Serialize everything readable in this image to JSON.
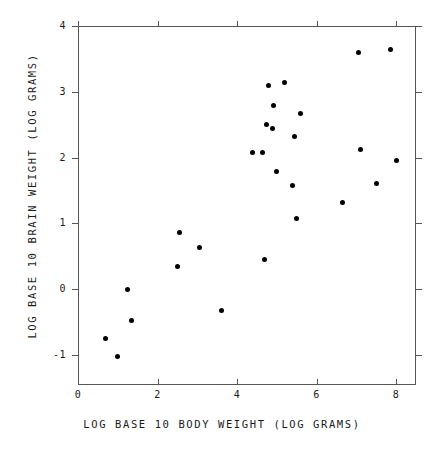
{
  "chart_data": {
    "type": "scatter",
    "title": "",
    "xlabel": "LOG BASE 10 BODY WEIGHT (LOG GRAMS)",
    "ylabel": "LOG BASE 10 BRAIN WEIGHT (LOG GRAMS)",
    "xlim": [
      0,
      8.5
    ],
    "ylim": [
      -1.5,
      4
    ],
    "xticks": [
      "0",
      "2",
      "4",
      "6",
      "8"
    ],
    "xtick_values": [
      0,
      2,
      4,
      6,
      8
    ],
    "yticks": [
      "4",
      "3",
      "2",
      "1",
      "0",
      "-1"
    ],
    "ytick_values": [
      4,
      3,
      2,
      1,
      0,
      -1
    ],
    "grid": false,
    "legend": "none",
    "marker": "filled-circle",
    "marker_color": "#000000",
    "frame_color": "#555555",
    "points": [
      {
        "x": 0.7,
        "y": -0.75
      },
      {
        "x": 1.0,
        "y": -1.02
      },
      {
        "x": 1.25,
        "y": -0.01
      },
      {
        "x": 1.35,
        "y": -0.47
      },
      {
        "x": 2.5,
        "y": 0.35
      },
      {
        "x": 2.55,
        "y": 0.86
      },
      {
        "x": 3.05,
        "y": 0.63
      },
      {
        "x": 3.6,
        "y": -0.32
      },
      {
        "x": 4.4,
        "y": 2.08
      },
      {
        "x": 4.65,
        "y": 2.08
      },
      {
        "x": 4.7,
        "y": 0.45
      },
      {
        "x": 4.75,
        "y": 2.5
      },
      {
        "x": 4.8,
        "y": 3.09
      },
      {
        "x": 4.9,
        "y": 2.44
      },
      {
        "x": 4.93,
        "y": 2.79
      },
      {
        "x": 5.0,
        "y": 1.79
      },
      {
        "x": 5.2,
        "y": 3.14
      },
      {
        "x": 5.4,
        "y": 1.57
      },
      {
        "x": 5.45,
        "y": 2.32
      },
      {
        "x": 5.5,
        "y": 1.08
      },
      {
        "x": 5.6,
        "y": 2.67
      },
      {
        "x": 6.65,
        "y": 1.32
      },
      {
        "x": 7.05,
        "y": 3.6
      },
      {
        "x": 7.1,
        "y": 2.13
      },
      {
        "x": 7.5,
        "y": 1.61
      },
      {
        "x": 7.85,
        "y": 3.65
      },
      {
        "x": 8.0,
        "y": 1.95
      }
    ]
  }
}
